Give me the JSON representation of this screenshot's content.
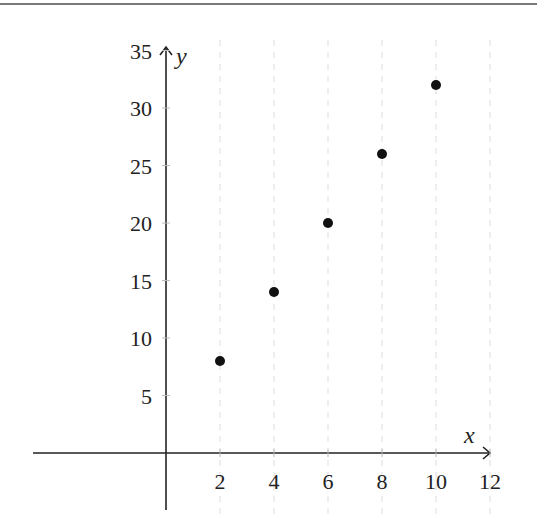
{
  "chart_data": {
    "type": "scatter",
    "title": "",
    "xlabel": "x",
    "ylabel": "y",
    "x": [
      2,
      4,
      6,
      8,
      10
    ],
    "y": [
      8,
      14,
      20,
      26,
      32
    ],
    "series": [
      {
        "name": "points",
        "x": [
          2,
          4,
          6,
          8,
          10
        ],
        "y": [
          8,
          14,
          20,
          26,
          32
        ]
      }
    ],
    "xticks": [
      2,
      4,
      6,
      8,
      10,
      12
    ],
    "yticks": [
      5,
      10,
      15,
      20,
      25,
      30,
      35
    ],
    "xlim": [
      -5,
      12
    ],
    "ylim": [
      -3,
      35
    ],
    "grid": "faint dashed vertical",
    "legend": null,
    "colors": {
      "point": "#111111",
      "axis": "#222222",
      "grid": "#dddddd"
    }
  },
  "axes": {
    "x_label": "x",
    "y_label": "y"
  }
}
